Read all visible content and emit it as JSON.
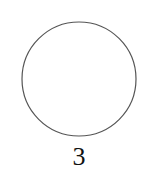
{
  "diagram": {
    "shape": "circle",
    "circle": {
      "cx": 79,
      "cy": 79,
      "r": 57,
      "stroke": "#555555",
      "fill": "#ffffff"
    },
    "label": "3"
  }
}
